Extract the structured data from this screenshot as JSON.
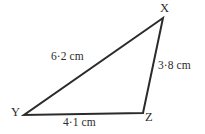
{
  "figure": {
    "kind": "triangle-diagram",
    "shape_name": "triangle XYZ",
    "stroke_color": "#2b2b2b",
    "text_color": "#2b2b2b",
    "background_color": "#ffffff",
    "vertices": [
      {
        "id": "X",
        "label": "X",
        "x": 163,
        "y": 18
      },
      {
        "id": "Y",
        "label": "Y",
        "x": 24,
        "y": 115
      },
      {
        "id": "Z",
        "label": "Z",
        "x": 143,
        "y": 113
      }
    ],
    "sides": [
      {
        "id": "YX",
        "label": "6·2 cm",
        "value": 6.2,
        "unit": "cm",
        "from": "Y",
        "to": "X"
      },
      {
        "id": "XZ",
        "label": "3·8 cm",
        "value": 3.8,
        "unit": "cm",
        "from": "X",
        "to": "Z"
      },
      {
        "id": "YZ",
        "label": "4·1 cm",
        "value": 4.1,
        "unit": "cm",
        "from": "Y",
        "to": "Z"
      }
    ]
  }
}
